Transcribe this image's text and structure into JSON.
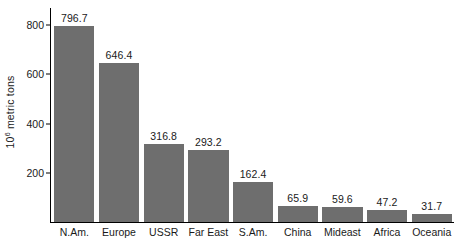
{
  "chart_data": {
    "type": "bar",
    "title": "",
    "subtitle": "",
    "xlabel": "",
    "ylabel": "10⁶ metric tons",
    "ylabel_mantissa": "10",
    "ylabel_exponent": "6",
    "ylabel_suffix": " metric tons",
    "categories": [
      "N.Am.",
      "Europe",
      "USSR",
      "Far East",
      "S.Am.",
      "China",
      "Mideast",
      "Africa",
      "Oceania"
    ],
    "values": [
      796.7,
      646.4,
      316.8,
      293.2,
      162.4,
      65.9,
      59.6,
      47.2,
      31.7
    ],
    "value_labels": [
      "796.7",
      "646.4",
      "316.8",
      "293.2",
      "162.4",
      "65.9",
      "59.6",
      "47.2",
      "31.7"
    ],
    "ylim": [
      0,
      870
    ],
    "yticks": [
      200,
      400,
      600,
      800
    ],
    "ytick_labels": [
      "200",
      "400",
      "600",
      "800"
    ],
    "grid": false,
    "legend": false,
    "legend_position": "none",
    "orientation": "vertical",
    "bar_color": "#6e6e6e",
    "axis_color": "#000000",
    "background_color": "#ffffff",
    "text_color": "#1a1a1a"
  }
}
